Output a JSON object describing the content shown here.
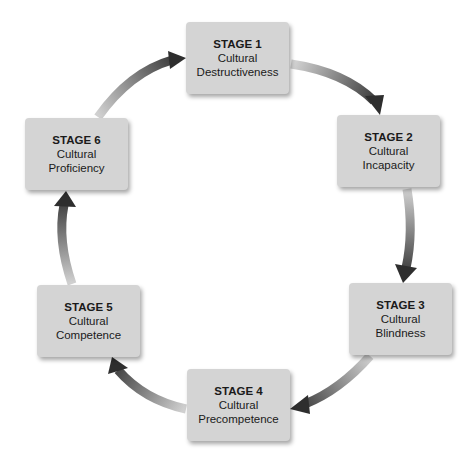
{
  "diagram": {
    "type": "cycle",
    "direction": "clockwise",
    "stages": [
      {
        "title": "STAGE 1",
        "line1": "Cultural",
        "line2": "Destructiveness"
      },
      {
        "title": "STAGE 2",
        "line1": "Cultural",
        "line2": "Incapacity"
      },
      {
        "title": "STAGE 3",
        "line1": "Cultural",
        "line2": "Blindness"
      },
      {
        "title": "STAGE 4",
        "line1": "Cultural",
        "line2": "Precompetence"
      },
      {
        "title": "STAGE 5",
        "line1": "Cultural",
        "line2": "Competence"
      },
      {
        "title": "STAGE 6",
        "line1": "Cultural",
        "line2": "Proficiency"
      }
    ],
    "arrows": [
      {
        "from": "STAGE 1",
        "to": "STAGE 2"
      },
      {
        "from": "STAGE 2",
        "to": "STAGE 3"
      },
      {
        "from": "STAGE 3",
        "to": "STAGE 4"
      },
      {
        "from": "STAGE 4",
        "to": "STAGE 5"
      },
      {
        "from": "STAGE 5",
        "to": "STAGE 6"
      },
      {
        "from": "STAGE 6",
        "to": "STAGE 1"
      }
    ],
    "colors": {
      "box_fill": "#d4d4d4",
      "arrow_light": "#cfcfcf",
      "arrow_dark": "#2e2e2e",
      "text": "#1a1a1a"
    }
  }
}
